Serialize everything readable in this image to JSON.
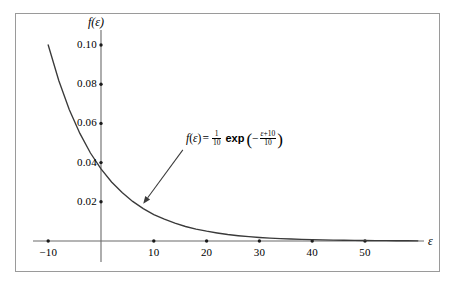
{
  "figure": {
    "background_color": "#ffffff",
    "frame_color": "#9a9a9a",
    "curve_color": "#3a3a3a",
    "axis_color": "#6b6b6b",
    "text_color": "#000000"
  },
  "annotation": {
    "prefix": "f",
    "arg_open": "(",
    "arg": "ε",
    "arg_close": ")",
    "equals": "=",
    "coef_num": "1",
    "coef_den": "10",
    "exp_label": "exp",
    "paren_open": "(",
    "minus": "−",
    "exp_num_var": "ε",
    "exp_num_plus": "+10",
    "exp_den": "10",
    "paren_close": ")",
    "full_text": "f(ε) = (1/10) exp(−(ε+10)/10)"
  },
  "chart_data": {
    "type": "line",
    "title": "",
    "xlabel": "ε",
    "ylabel": "f(ε)",
    "xlim": [
      -12,
      62
    ],
    "ylim": [
      0,
      0.108
    ],
    "grid": false,
    "legend": "none",
    "x_ticks": [
      -10,
      10,
      20,
      30,
      40,
      50
    ],
    "x_tick_labels": [
      "−10",
      "10",
      "20",
      "30",
      "40",
      "50"
    ],
    "y_ticks": [
      0.02,
      0.04,
      0.06,
      0.08,
      0.1
    ],
    "y_tick_labels": [
      "0.02",
      "0.04",
      "0.06",
      "0.08",
      "0.10"
    ],
    "series": [
      {
        "name": "f(ε) = (1/10) exp(−(ε+10)/10)",
        "formula": "0.1*exp(-(x+10)/10)",
        "x": [
          -10,
          -8,
          -6,
          -4,
          -2,
          0,
          2,
          4,
          6,
          8,
          10,
          12,
          14,
          16,
          18,
          20,
          22,
          24,
          26,
          28,
          30,
          32,
          34,
          36,
          38,
          40,
          42,
          44,
          46,
          48,
          50,
          52,
          54,
          56,
          58,
          60
        ],
        "y": [
          0.1,
          0.0819,
          0.067,
          0.0549,
          0.0449,
          0.0368,
          0.0301,
          0.0247,
          0.0202,
          0.0165,
          0.0135,
          0.0111,
          0.0091,
          0.0074,
          0.0061,
          0.005,
          0.0041,
          0.0033,
          0.0027,
          0.0022,
          0.0018,
          0.0015,
          0.0012,
          0.001,
          0.0008,
          0.00067,
          0.00055,
          0.00045,
          0.00037,
          0.0003,
          0.00025,
          0.0002,
          0.00017,
          0.00014,
          0.00011,
          9e-05
        ]
      }
    ],
    "annotation_arrow": {
      "from_x": 15.5,
      "from_y": 0.0465,
      "to_x": 8.0,
      "to_y": 0.019
    }
  }
}
